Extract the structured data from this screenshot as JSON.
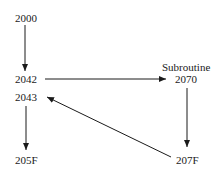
{
  "diagram": {
    "type": "flow",
    "nodes": [
      {
        "id": "n2000",
        "label": "2000"
      },
      {
        "id": "n2042",
        "label": "2042"
      },
      {
        "id": "n2043",
        "label": "2043"
      },
      {
        "id": "n205F",
        "label": "205F"
      },
      {
        "id": "n2070",
        "title": "Subroutine",
        "label": "2070"
      },
      {
        "id": "n207F",
        "label": "207F"
      }
    ],
    "edges": [
      {
        "from": "2000",
        "to": "2042"
      },
      {
        "from": "2042",
        "to": "2070"
      },
      {
        "from": "2070",
        "to": "207F"
      },
      {
        "from": "207F",
        "to": "2043"
      },
      {
        "from": "2043",
        "to": "205F"
      }
    ],
    "colors": {
      "line": "#1a1a1a",
      "background": "#ffffff"
    }
  }
}
